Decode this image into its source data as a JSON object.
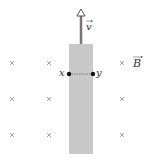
{
  "diagram": {
    "bar_color": "#c8c8c8",
    "cross_color": "#999999",
    "velocity": {
      "label": "v",
      "vector": true,
      "direction": "up"
    },
    "field": {
      "label": "B",
      "vector": true,
      "direction": "into-page",
      "symbol": "×"
    },
    "points": [
      {
        "label": "x",
        "side": "left"
      },
      {
        "label": "y",
        "side": "right"
      }
    ],
    "cross_columns_x": [
      12,
      49,
      122
    ],
    "cross_rows_y": [
      63,
      99,
      135
    ]
  }
}
